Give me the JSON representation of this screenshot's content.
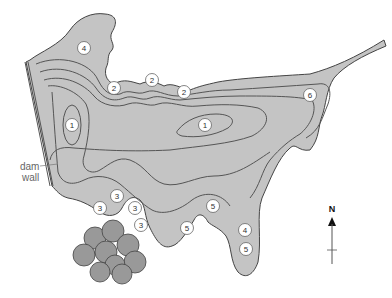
{
  "diagram": {
    "type": "reservoir contour map",
    "dam_label_line1": "dam",
    "dam_label_line2": "wall",
    "north_label": "N",
    "colors": {
      "water": "#c4c4c4",
      "contour": "#555555",
      "outline": "#444444",
      "marker_fill": "#ffffff",
      "vegetation": "#888888"
    },
    "markers": [
      {
        "id": "m4a",
        "label": "4",
        "x": 84,
        "y": 48
      },
      {
        "id": "m2a",
        "label": "2",
        "x": 114,
        "y": 88
      },
      {
        "id": "m2b",
        "label": "2",
        "x": 152,
        "y": 80
      },
      {
        "id": "m2c",
        "label": "2",
        "x": 184,
        "y": 92
      },
      {
        "id": "m6",
        "label": "6",
        "x": 310,
        "y": 95
      },
      {
        "id": "m1a",
        "label": "1",
        "x": 72,
        "y": 125
      },
      {
        "id": "m1b",
        "label": "1",
        "x": 205,
        "y": 125
      },
      {
        "id": "m3a",
        "label": "3",
        "x": 117,
        "y": 196
      },
      {
        "id": "m3b",
        "label": "3",
        "x": 100,
        "y": 208
      },
      {
        "id": "m3c",
        "label": "3",
        "x": 135,
        "y": 208
      },
      {
        "id": "m3d",
        "label": "3",
        "x": 141,
        "y": 225
      },
      {
        "id": "m5a",
        "label": "5",
        "x": 213,
        "y": 206
      },
      {
        "id": "m5b",
        "label": "5",
        "x": 187,
        "y": 228
      },
      {
        "id": "m4b",
        "label": "4",
        "x": 245,
        "y": 230
      },
      {
        "id": "m5c",
        "label": "5",
        "x": 246,
        "y": 249
      }
    ]
  }
}
